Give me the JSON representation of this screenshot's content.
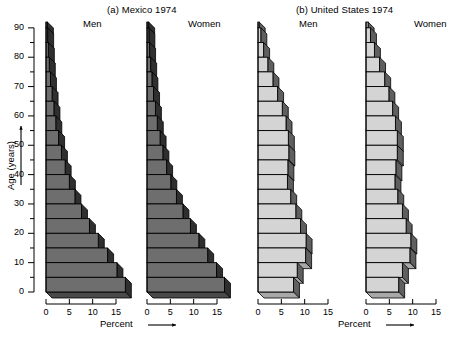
{
  "figure": {
    "panels": [
      {
        "id": "mexico",
        "title": "(a)  Mexico 1974"
      },
      {
        "id": "united-states",
        "title": "(b)  United States 1974"
      }
    ],
    "sex_labels": {
      "men": "Men",
      "women": "Women"
    },
    "y_axis": {
      "label": "Age (years)",
      "arrow": "↑"
    },
    "x_axis": {
      "label": "Percent",
      "arrow": "→"
    },
    "x_tick_labels": [
      "0",
      "5",
      "10",
      "15"
    ],
    "y_tick_labels": [
      "0",
      "10",
      "20",
      "30",
      "40",
      "50",
      "60",
      "70",
      "80",
      "90"
    ],
    "colors": {
      "mexico_face": "#6e6e6e",
      "mexico_side": "#2f2f2f",
      "mexico_top": "#4a4a4a",
      "us_face": "#d4d4d4",
      "us_side": "#5f5f5f",
      "us_top": "#a8a8a8",
      "outline": "#000000",
      "background": "#ffffff"
    }
  },
  "chart_data": {
    "type": "bar",
    "xlabel": "Percent",
    "ylabel": "Age (years)",
    "xlim": [
      0,
      18
    ],
    "ylim": [
      0,
      92
    ],
    "x_ticks": [
      0,
      5,
      10,
      15
    ],
    "y_ticks": [
      0,
      10,
      20,
      30,
      40,
      50,
      60,
      70,
      80,
      90
    ],
    "y_minor_tick_step": 5,
    "grid": false,
    "legend": "none",
    "orientation": "horizontal",
    "age_groups": [
      "0-4",
      "5-9",
      "10-14",
      "15-19",
      "20-24",
      "25-29",
      "30-34",
      "35-39",
      "40-44",
      "45-49",
      "50-54",
      "55-59",
      "60-64",
      "65-69",
      "70-74",
      "75-79",
      "80-84",
      "85-89",
      "90+"
    ],
    "age_group_lower_bounds": [
      0,
      5,
      10,
      15,
      20,
      25,
      30,
      35,
      40,
      45,
      50,
      55,
      60,
      65,
      70,
      75,
      80,
      85,
      90
    ],
    "panels": [
      {
        "name": "(a)  Mexico 1974",
        "series": [
          {
            "name": "Men",
            "values": [
              17.0,
              15.2,
              13.2,
              11.2,
              9.3,
              7.6,
              6.2,
              5.0,
              4.1,
              3.3,
              2.7,
              2.1,
              1.7,
              1.3,
              0.95,
              0.7,
              0.5,
              0.35,
              0.3
            ]
          },
          {
            "name": "Women",
            "values": [
              16.6,
              14.9,
              13.0,
              11.1,
              9.3,
              7.7,
              6.3,
              5.1,
              4.2,
              3.4,
              2.8,
              2.2,
              1.8,
              1.4,
              1.05,
              0.78,
              0.55,
              0.4,
              0.35
            ]
          }
        ]
      },
      {
        "name": "(b)  United States 1974",
        "series": [
          {
            "name": "Men",
            "values": [
              7.6,
              8.4,
              10.2,
              10.3,
              9.1,
              8.1,
              7.0,
              6.3,
              6.4,
              6.6,
              6.5,
              6.0,
              5.2,
              4.2,
              3.2,
              2.1,
              1.2,
              0.6,
              0.25
            ]
          },
          {
            "name": "Women",
            "values": [
              7.0,
              7.8,
              9.4,
              9.6,
              8.6,
              7.8,
              6.8,
              6.2,
              6.4,
              6.7,
              6.7,
              6.3,
              5.7,
              4.9,
              4.0,
              2.9,
              1.8,
              0.95,
              0.45
            ]
          }
        ]
      }
    ]
  }
}
